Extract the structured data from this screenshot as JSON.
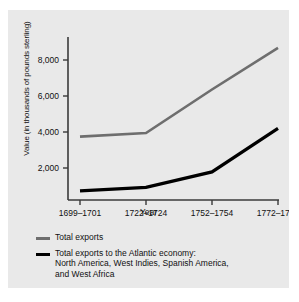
{
  "chart_data": {
    "type": "line",
    "title": "",
    "xlabel": "Year",
    "ylabel": "Value (in thousands of pounds sterling)",
    "categories": [
      "1699–1701",
      "1722–1724",
      "1752–1754",
      "1772–1774"
    ],
    "ylim": [
      0,
      9000
    ],
    "yticks": [
      2000,
      4000,
      6000,
      8000
    ],
    "ytick_labels": [
      "2,000",
      "4,000",
      "6,000",
      "8,000"
    ],
    "grid": false,
    "legend_position": "below",
    "series": [
      {
        "name": "Total exports",
        "color": "#6e6e6e",
        "values": [
          3500,
          3700,
          6100,
          8400
        ]
      },
      {
        "name": "Total exports to the Atlantic economy: North America, West Indies, Spanish America, and West Africa",
        "color": "#000000",
        "values": [
          500,
          700,
          1550,
          3950
        ]
      }
    ]
  },
  "axes": {
    "y_title": "Value (in thousands of pounds sterling)",
    "x_title": "Year",
    "y_tick_labels": [
      "8,000",
      "6,000",
      "4,000",
      "2,000"
    ],
    "x_tick_labels": [
      "1699–1701",
      "1722–1724",
      "1752–1754",
      "1772–1774"
    ]
  },
  "legend": {
    "entries": [
      {
        "swatch_color": "#6e6e6e",
        "line1": "Total exports",
        "line2": "",
        "line3": ""
      },
      {
        "swatch_color": "#000000",
        "line1": "Total exports to the Atlantic economy:",
        "line2": "North America, West Indies, Spanish America,",
        "line3": "and West Africa"
      }
    ]
  },
  "colors": {
    "panel_background": "#e9e9e9",
    "page_background": "#ffffff",
    "axis": "#3a3a3a",
    "series_total": "#6e6e6e",
    "series_atlantic": "#000000"
  }
}
